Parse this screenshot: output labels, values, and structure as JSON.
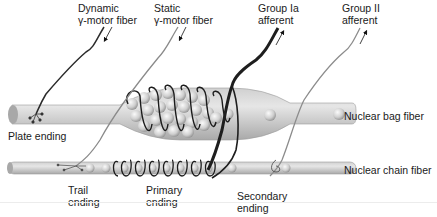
{
  "diagram": {
    "labels": {
      "dynamic_gamma": [
        "Dynamic",
        "γ-motor fiber"
      ],
      "static_gamma": [
        "Static",
        "γ-motor fiber"
      ],
      "group_ia": [
        "Group Ia",
        "afferent"
      ],
      "group_ii": [
        "Group II",
        "afferent"
      ],
      "plate_ending": "Plate ending",
      "nuclear_bag": "Nuclear bag fiber",
      "nuclear_chain": "Nuclear chain fiber",
      "trail_ending": [
        "Trail",
        "ending"
      ],
      "primary_ending": [
        "Primary",
        "ending"
      ],
      "secondary_ending": [
        "Secondary",
        "ending"
      ]
    },
    "arrows": {
      "motor_fibers": "inward (toward muscle)",
      "afferents": "outward (toward CNS)"
    },
    "colors": {
      "fiber_body": "#b9b9b9",
      "fiber_highlight": "#e2e2e2",
      "nucleus": "#d4d4d4",
      "dynamic_fiber": "#2b2b2b",
      "static_fiber": "#8a8a8a",
      "group_ia_fiber": "#1e1e1e",
      "group_ii_fiber": "#8c8c8c"
    }
  }
}
